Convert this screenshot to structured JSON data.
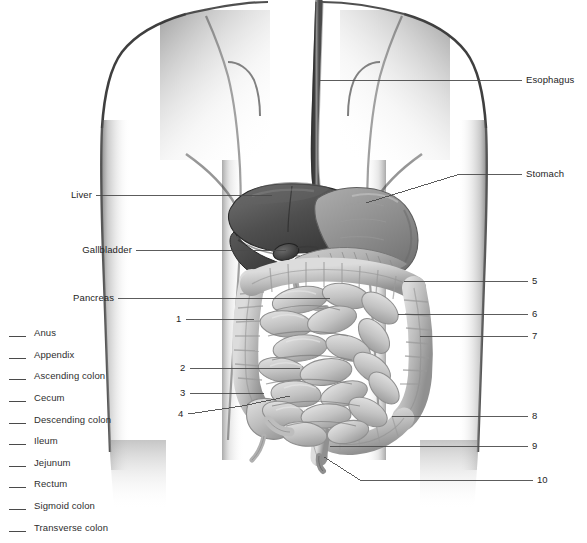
{
  "figure": {
    "style": "grayscale medical illustration"
  },
  "word_bank": {
    "blank_mark": "___",
    "items": [
      {
        "label": "Anus"
      },
      {
        "label": "Appendix"
      },
      {
        "label": "Ascending colon"
      },
      {
        "label": "Cecum"
      },
      {
        "label": "Descending colon"
      },
      {
        "label": "Ileum"
      },
      {
        "label": "Jejunum"
      },
      {
        "label": "Rectum"
      },
      {
        "label": "Sigmoid colon"
      },
      {
        "label": "Transverse colon"
      }
    ]
  },
  "named_callouts": {
    "esophagus": "Esophagus",
    "stomach": "Stomach",
    "liver": "Liver",
    "gallbladder": "Gallbladder",
    "pancreas": "Pancreas"
  },
  "numbered_callouts": {
    "left": [
      "1",
      "2",
      "3",
      "4"
    ],
    "right": [
      "5",
      "6",
      "7",
      "8",
      "9",
      "10"
    ]
  },
  "colors": {
    "ink": "#2b2b2b",
    "leader_line": "#4a4a4a",
    "body_outline": "#3a3a3a",
    "liver_dark": "#4b4b4b",
    "stomach_mid": "#8d8d8d",
    "intestine_light": "#c9c9c9",
    "background": "#ffffff"
  }
}
